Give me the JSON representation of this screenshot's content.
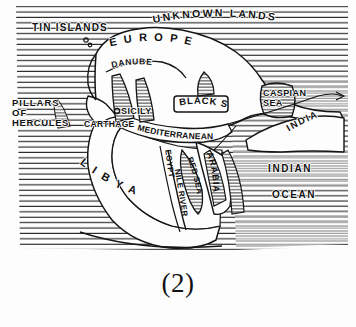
{
  "figure": {
    "caption": "(2)",
    "style": "hand-drawn pen-and-ink ancient world map",
    "colors": {
      "ink": "#111111",
      "paper": "#fdfdfd"
    }
  },
  "map": {
    "title_region": "ancient-world-map",
    "labels": {
      "unknown_lands": "UNKNOWN LANDS",
      "tin_islands": "TIN ISLANDS",
      "europe": "EUROPE",
      "europe_letters": [
        "E",
        "U",
        "R",
        "O",
        "P",
        "E"
      ],
      "danube": "DANUBE",
      "black_sea": "BLACK SEA",
      "caspian_sea_line1": "CASPIAN",
      "caspian_sea_line2": "SEA",
      "pillars_line1": "PILLARS",
      "pillars_line2": "OF",
      "pillars_line3": "HERCULES",
      "sicily": "SICILY",
      "carthage": "CARTHAGE",
      "mediterranean": "MEDITERRANEAN",
      "libya": "LIBYA",
      "libya_letters": [
        "L",
        "I",
        "B",
        "Y",
        "A"
      ],
      "egypt": "EGYPT",
      "nile_river": "NILE RIVER",
      "red_sea": "RED SEA",
      "arabia": "ARABIA",
      "india": "INDIA",
      "indian": "INDIAN",
      "ocean": "OCEAN"
    }
  }
}
